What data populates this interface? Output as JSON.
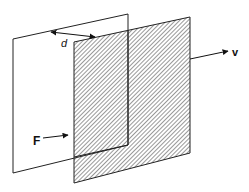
{
  "diagram": {
    "labels": {
      "distance": "d",
      "velocity": "v",
      "force": "F"
    },
    "colors": {
      "stroke": "#222222",
      "hatch": "#333333",
      "background": "#ffffff"
    }
  }
}
